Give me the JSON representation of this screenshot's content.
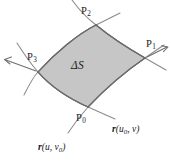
{
  "figure": {
    "kind": "surface-patch-diagram",
    "background_color": "#ffffff",
    "patch_fill_color": "#c6c6c6",
    "patch_stroke_color": "#6b6b6b",
    "curve_color": "#8a8a8a",
    "text_color": "#1a1a1a",
    "area_label": "ΔS",
    "points": [
      {
        "id": "P0",
        "letter": "P",
        "index": "0",
        "position": "bottom"
      },
      {
        "id": "P1",
        "letter": "P",
        "index": "1",
        "position": "right"
      },
      {
        "id": "P2",
        "letter": "P",
        "index": "2",
        "position": "top"
      },
      {
        "id": "P3",
        "letter": "P",
        "index": "3",
        "position": "left"
      }
    ],
    "curve_labels": [
      {
        "id": "r-u0-v",
        "vector": "r",
        "open_paren": "(",
        "arg1": "u",
        "arg1_sub": "0",
        "comma": ", ",
        "arg2": "v",
        "arg2_sub": "",
        "close_paren": ")",
        "position": "bottom-right"
      },
      {
        "id": "r-u-v0",
        "vector": "r",
        "open_paren": "(",
        "arg1": "u",
        "arg1_sub": "",
        "comma": ", ",
        "arg2": "v",
        "arg2_sub": "0",
        "close_paren": ")",
        "position": "bottom-left"
      }
    ],
    "arrows": [
      {
        "id": "arrow-p1",
        "label_ref": "P1",
        "direction": "upper-right"
      },
      {
        "id": "arrow-p3",
        "label_ref": "P3",
        "direction": "upper-left"
      }
    ]
  }
}
